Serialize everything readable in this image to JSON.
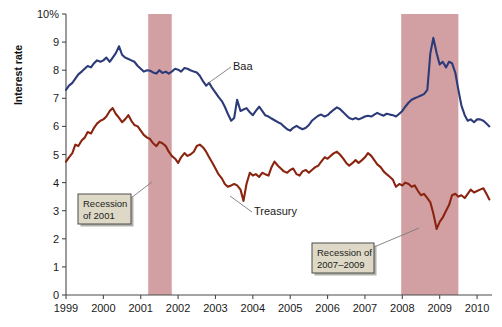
{
  "chart_data": {
    "type": "line",
    "title": "",
    "xlabel": "",
    "ylabel": "Interest rate",
    "ylim": [
      0,
      10
    ],
    "xlim": [
      1999,
      2010.4
    ],
    "grid": false,
    "legend_position": "inline-annotations",
    "y_ticks": [
      "0",
      "1",
      "2",
      "3",
      "4",
      "5",
      "6",
      "7",
      "8",
      "9",
      "10%"
    ],
    "y_tick_values": [
      0,
      1,
      2,
      3,
      4,
      5,
      6,
      7,
      8,
      9,
      10
    ],
    "x_ticks": [
      "1999",
      "2000",
      "2001",
      "2002",
      "2003",
      "2004",
      "2005",
      "2006",
      "2007",
      "2008",
      "2009",
      "2010"
    ],
    "x_tick_values": [
      1999,
      2000,
      2001,
      2002,
      2003,
      2004,
      2005,
      2006,
      2007,
      2008,
      2009,
      2010
    ],
    "series": [
      {
        "name": "Baa",
        "color": "#2c3a78",
        "x": [
          1999.0,
          1999.08,
          1999.17,
          1999.25,
          1999.33,
          1999.42,
          1999.5,
          1999.58,
          1999.67,
          1999.75,
          1999.83,
          1999.92,
          2000.0,
          2000.08,
          2000.17,
          2000.25,
          2000.33,
          2000.42,
          2000.5,
          2000.58,
          2000.67,
          2000.75,
          2000.83,
          2000.92,
          2001.0,
          2001.08,
          2001.17,
          2001.25,
          2001.33,
          2001.42,
          2001.5,
          2001.58,
          2001.67,
          2001.75,
          2001.83,
          2001.92,
          2002.0,
          2002.08,
          2002.17,
          2002.25,
          2002.33,
          2002.42,
          2002.5,
          2002.58,
          2002.67,
          2002.75,
          2002.83,
          2002.92,
          2003.0,
          2003.08,
          2003.17,
          2003.25,
          2003.33,
          2003.42,
          2003.5,
          2003.58,
          2003.67,
          2003.75,
          2003.83,
          2003.92,
          2004.0,
          2004.08,
          2004.17,
          2004.25,
          2004.33,
          2004.42,
          2004.5,
          2004.58,
          2004.67,
          2004.75,
          2004.83,
          2004.92,
          2005.0,
          2005.08,
          2005.17,
          2005.25,
          2005.33,
          2005.42,
          2005.5,
          2005.58,
          2005.67,
          2005.75,
          2005.83,
          2005.92,
          2006.0,
          2006.08,
          2006.17,
          2006.25,
          2006.33,
          2006.42,
          2006.5,
          2006.58,
          2006.67,
          2006.75,
          2006.83,
          2006.92,
          2007.0,
          2007.08,
          2007.17,
          2007.25,
          2007.33,
          2007.42,
          2007.5,
          2007.58,
          2007.67,
          2007.75,
          2007.83,
          2007.92,
          2008.0,
          2008.08,
          2008.17,
          2008.25,
          2008.33,
          2008.42,
          2008.5,
          2008.58,
          2008.67,
          2008.75,
          2008.83,
          2008.92,
          2009.0,
          2009.08,
          2009.17,
          2009.25,
          2009.33,
          2009.42,
          2009.5,
          2009.58,
          2009.67,
          2009.75,
          2009.83,
          2009.92,
          2010.0,
          2010.08,
          2010.17,
          2010.25,
          2010.33
        ],
        "values": [
          7.3,
          7.45,
          7.55,
          7.7,
          7.85,
          7.95,
          8.05,
          8.15,
          8.1,
          8.25,
          8.35,
          8.3,
          8.35,
          8.45,
          8.3,
          8.45,
          8.6,
          8.85,
          8.55,
          8.45,
          8.4,
          8.35,
          8.3,
          8.15,
          8.05,
          7.95,
          8.0,
          7.98,
          7.92,
          7.88,
          8.0,
          7.9,
          7.95,
          7.88,
          7.95,
          8.05,
          8.02,
          7.95,
          8.08,
          8.05,
          8.0,
          7.95,
          7.92,
          7.8,
          7.6,
          7.45,
          7.55,
          7.35,
          7.2,
          7.05,
          6.9,
          6.7,
          6.45,
          6.2,
          6.3,
          6.95,
          6.55,
          6.6,
          6.65,
          6.5,
          6.4,
          6.55,
          6.7,
          6.55,
          6.4,
          6.35,
          6.28,
          6.22,
          6.15,
          6.1,
          6.0,
          5.9,
          5.85,
          5.95,
          6.02,
          5.95,
          5.9,
          5.95,
          6.05,
          6.2,
          6.3,
          6.38,
          6.42,
          6.35,
          6.4,
          6.5,
          6.6,
          6.68,
          6.62,
          6.5,
          6.4,
          6.3,
          6.25,
          6.3,
          6.25,
          6.3,
          6.35,
          6.38,
          6.35,
          6.42,
          6.48,
          6.42,
          6.38,
          6.45,
          6.42,
          6.4,
          6.35,
          6.45,
          6.55,
          6.7,
          6.85,
          6.95,
          7.0,
          7.05,
          7.1,
          7.15,
          7.3,
          8.6,
          9.15,
          8.6,
          8.2,
          8.3,
          8.1,
          8.3,
          8.25,
          7.9,
          7.3,
          6.75,
          6.4,
          6.2,
          6.25,
          6.15,
          6.25,
          6.25,
          6.2,
          6.1,
          6.0
        ],
        "annotation_label": "Baa"
      },
      {
        "name": "Treasury",
        "color": "#8a2410",
        "x": [
          1999.0,
          1999.08,
          1999.17,
          1999.25,
          1999.33,
          1999.42,
          1999.5,
          1999.58,
          1999.67,
          1999.75,
          1999.83,
          1999.92,
          2000.0,
          2000.08,
          2000.17,
          2000.25,
          2000.33,
          2000.42,
          2000.5,
          2000.58,
          2000.67,
          2000.75,
          2000.83,
          2000.92,
          2001.0,
          2001.08,
          2001.17,
          2001.25,
          2001.33,
          2001.42,
          2001.5,
          2001.58,
          2001.67,
          2001.75,
          2001.83,
          2001.92,
          2002.0,
          2002.08,
          2002.17,
          2002.25,
          2002.33,
          2002.42,
          2002.5,
          2002.58,
          2002.67,
          2002.75,
          2002.83,
          2002.92,
          2003.0,
          2003.08,
          2003.17,
          2003.25,
          2003.33,
          2003.42,
          2003.5,
          2003.58,
          2003.67,
          2003.75,
          2003.83,
          2003.92,
          2004.0,
          2004.08,
          2004.17,
          2004.25,
          2004.33,
          2004.42,
          2004.5,
          2004.58,
          2004.67,
          2004.75,
          2004.83,
          2004.92,
          2005.0,
          2005.08,
          2005.17,
          2005.25,
          2005.33,
          2005.42,
          2005.5,
          2005.58,
          2005.67,
          2005.75,
          2005.83,
          2005.92,
          2006.0,
          2006.08,
          2006.17,
          2006.25,
          2006.33,
          2006.42,
          2006.5,
          2006.58,
          2006.67,
          2006.75,
          2006.83,
          2006.92,
          2007.0,
          2007.08,
          2007.17,
          2007.25,
          2007.33,
          2007.42,
          2007.5,
          2007.58,
          2007.67,
          2007.75,
          2007.83,
          2007.92,
          2008.0,
          2008.08,
          2008.17,
          2008.25,
          2008.33,
          2008.42,
          2008.5,
          2008.58,
          2008.67,
          2008.75,
          2008.83,
          2008.92,
          2009.0,
          2009.08,
          2009.17,
          2009.25,
          2009.33,
          2009.42,
          2009.5,
          2009.58,
          2009.67,
          2009.75,
          2009.83,
          2009.92,
          2010.0,
          2010.08,
          2010.17,
          2010.25,
          2010.33
        ],
        "values": [
          4.75,
          4.9,
          5.05,
          5.35,
          5.3,
          5.5,
          5.6,
          5.8,
          5.75,
          5.95,
          6.1,
          6.2,
          6.25,
          6.35,
          6.55,
          6.65,
          6.45,
          6.3,
          6.15,
          6.25,
          6.4,
          6.2,
          6.05,
          6.0,
          5.85,
          5.7,
          5.6,
          5.55,
          5.4,
          5.3,
          5.45,
          5.4,
          5.3,
          5.1,
          4.95,
          4.85,
          4.7,
          4.9,
          5.05,
          4.95,
          5.0,
          5.1,
          5.3,
          5.35,
          5.25,
          5.1,
          4.9,
          4.7,
          4.5,
          4.3,
          4.15,
          3.95,
          3.85,
          3.9,
          3.95,
          3.9,
          3.75,
          3.35,
          3.95,
          4.35,
          4.25,
          4.3,
          4.2,
          4.35,
          4.3,
          4.25,
          4.55,
          4.75,
          4.6,
          4.5,
          4.4,
          4.35,
          4.45,
          4.5,
          4.3,
          4.25,
          4.4,
          4.45,
          4.35,
          4.45,
          4.55,
          4.6,
          4.75,
          4.9,
          4.85,
          4.95,
          5.05,
          5.1,
          5.0,
          4.85,
          4.7,
          4.6,
          4.7,
          4.8,
          4.7,
          4.8,
          4.9,
          5.05,
          4.95,
          4.8,
          4.65,
          4.55,
          4.4,
          4.3,
          4.2,
          4.1,
          3.85,
          3.95,
          3.9,
          4.0,
          3.95,
          3.85,
          3.9,
          3.7,
          3.55,
          3.6,
          3.45,
          3.3,
          2.9,
          2.35,
          2.6,
          2.75,
          3.0,
          3.2,
          3.55,
          3.6,
          3.5,
          3.55,
          3.45,
          3.6,
          3.75,
          3.65,
          3.7,
          3.75,
          3.8,
          3.6,
          3.4
        ],
        "annotation_label": "Treasury"
      }
    ],
    "shaded_regions": [
      {
        "label": "Recession of 2001",
        "start": 2001.2,
        "end": 2001.83,
        "color": "#d2a0a3"
      },
      {
        "label": "Recession of 2007–2009",
        "start": 2007.97,
        "end": 2009.5,
        "color": "#d2a0a3"
      }
    ],
    "annotations": [
      {
        "id": "recession-2001",
        "lines": [
          "Recession",
          "of 2001"
        ],
        "box_x": 78,
        "box_y": 194,
        "box_w": 53,
        "box_h": 30
      },
      {
        "id": "recession-2007-2009",
        "lines": [
          "Recession of",
          "2007–2009"
        ],
        "box_x": 312,
        "box_y": 243,
        "box_w": 62,
        "box_h": 30
      },
      {
        "id": "baa-label",
        "lines": [
          "Baa"
        ],
        "box_x": 233,
        "box_y": 70,
        "box_w": 0,
        "box_h": 0
      },
      {
        "id": "treasury-label",
        "lines": [
          "Treasury"
        ],
        "box_x": 254,
        "box_y": 215,
        "box_w": 0,
        "box_h": 0
      }
    ]
  }
}
